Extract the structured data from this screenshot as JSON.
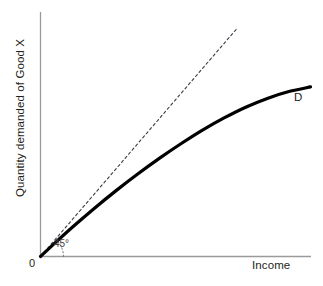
{
  "chart_data": {
    "type": "line",
    "title": "",
    "subtitle": "",
    "xlabel": "Income",
    "ylabel": "Quantity demanded of Good X",
    "xlim": [
      0,
      1
    ],
    "ylim": [
      0,
      1
    ],
    "grid": false,
    "legend": "none",
    "axis_origin_label": "0",
    "annotations": [
      {
        "name": "curve-label",
        "text": "D",
        "x": 0.94,
        "y": 0.645
      },
      {
        "name": "angle-label",
        "text": "45°",
        "x": 0.055,
        "y": 0.055
      }
    ],
    "series": [
      {
        "name": "D",
        "label": "D",
        "style": "solid",
        "color": "#000000",
        "width": 3.2,
        "description": "Engel curve: quantity demanded of Good X rising with income at a decreasing rate",
        "x": [
          0.0,
          0.06,
          0.12,
          0.2,
          0.28,
          0.36,
          0.44,
          0.52,
          0.6,
          0.68,
          0.76,
          0.84,
          0.92,
          1.0
        ],
        "y": [
          0.0,
          0.062,
          0.122,
          0.198,
          0.27,
          0.338,
          0.402,
          0.462,
          0.518,
          0.568,
          0.612,
          0.648,
          0.676,
          0.695
        ]
      },
      {
        "name": "45-degree-line",
        "label": "45° line",
        "style": "dashed",
        "color": "#3b3b4a",
        "width": 1,
        "description": "45 degree reference ray from the origin",
        "x": [
          0.0,
          0.728
        ],
        "y": [
          0.0,
          0.935
        ]
      }
    ],
    "angle_arc": {
      "name": "angle-arc",
      "style": "dotted",
      "color": "#6b6b75",
      "degrees": 45,
      "radius": 0.085
    },
    "colors": {
      "axis": "#9a9a9a",
      "curve": "#000000",
      "reference_line": "#3b3b4a",
      "text": "#231f20",
      "background": "#ffffff"
    }
  },
  "axes": {
    "x_title": "Income",
    "y_title": "Quantity demanded of Good X",
    "origin": "0"
  },
  "labels": {
    "curve": "D",
    "angle": "45°"
  }
}
